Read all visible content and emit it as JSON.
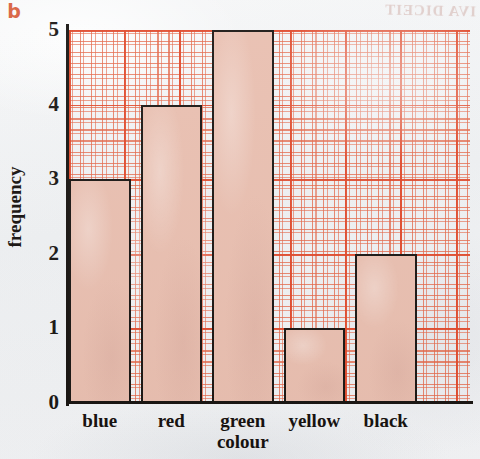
{
  "figure": {
    "part_label": "b",
    "bleed_through_text": "IVA DICEIT"
  },
  "chart_data": {
    "type": "bar",
    "title": "",
    "subtitle": "",
    "xlabel": "colour",
    "ylabel": "frequency",
    "categories": [
      "blue",
      "red",
      "green",
      "yellow",
      "black"
    ],
    "values": [
      3,
      4,
      5,
      1,
      2
    ],
    "ylim": [
      0,
      5
    ],
    "ytick_labels": [
      "0",
      "1",
      "2",
      "3",
      "4",
      "5"
    ],
    "xtick_labels": [
      "blue",
      "red",
      "green",
      "yellow",
      "black"
    ],
    "grid": true,
    "grid_style": "graph-paper",
    "legend": "none",
    "annotations": [],
    "colors": {
      "bar_fill": "#e9bfb0",
      "bar_edge": "#1b1714",
      "grid_major": "#e0482a",
      "grid_minor": "#e4684a",
      "axis": "#191512",
      "text": "#17120f",
      "background": "#f1f2f4",
      "part_label": "#d8603f"
    }
  }
}
